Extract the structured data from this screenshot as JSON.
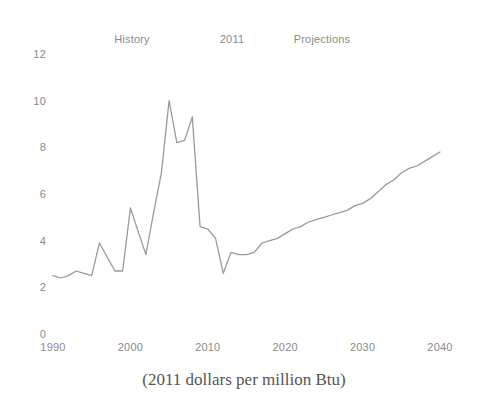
{
  "header": {
    "history_label": "History",
    "divider_year_label": "2011",
    "projections_label": "Projections"
  },
  "caption": "(2011 dollars per million Btu)",
  "axis": {
    "y_ticks": [
      "0",
      "2",
      "4",
      "6",
      "8",
      "10",
      "12"
    ],
    "x_ticks": [
      "1990",
      "2000",
      "2010",
      "2020",
      "2030",
      "2040"
    ]
  },
  "style": {
    "line_color": "#9a9a9a",
    "text_color": "#8a8a8a",
    "caption_color": "#555555",
    "background": "#ffffff"
  },
  "chart_data": {
    "type": "line",
    "title": "",
    "subtitle": "",
    "xlabel": "",
    "ylabel": "",
    "caption": "(2011 dollars per million Btu)",
    "xlim": [
      1990,
      2040
    ],
    "ylim": [
      0,
      12
    ],
    "grid": false,
    "legend_position": "none",
    "annotations": [
      {
        "text": "History",
        "x": 1990,
        "note": "region label for historical data left of 2011"
      },
      {
        "text": "2011",
        "x": 2011,
        "note": "boundary year between history and projections"
      },
      {
        "text": "Projections",
        "x": 2030,
        "note": "region label for projected data right of 2011"
      }
    ],
    "series": [
      {
        "name": "Natural gas price",
        "units": "2011 dollars per million Btu",
        "x": [
          1990,
          1991,
          1992,
          1993,
          1994,
          1995,
          1996,
          1997,
          1998,
          1999,
          2000,
          2001,
          2002,
          2003,
          2004,
          2005,
          2006,
          2007,
          2008,
          2009,
          2010,
          2011,
          2012,
          2013,
          2014,
          2015,
          2016,
          2017,
          2018,
          2019,
          2020,
          2021,
          2022,
          2023,
          2024,
          2025,
          2026,
          2027,
          2028,
          2029,
          2030,
          2031,
          2032,
          2033,
          2034,
          2035,
          2036,
          2037,
          2038,
          2039,
          2040
        ],
        "y": [
          2.5,
          2.4,
          2.5,
          2.7,
          2.6,
          2.5,
          3.9,
          3.3,
          2.7,
          2.7,
          5.4,
          4.4,
          3.4,
          5.2,
          6.9,
          10.0,
          8.2,
          8.3,
          9.3,
          4.6,
          4.5,
          4.1,
          2.6,
          3.5,
          3.4,
          3.4,
          3.5,
          3.9,
          4.0,
          4.1,
          4.3,
          4.5,
          4.6,
          4.8,
          4.9,
          5.0,
          5.1,
          5.2,
          5.3,
          5.5,
          5.6,
          5.8,
          6.1,
          6.4,
          6.6,
          6.9,
          7.1,
          7.2,
          7.4,
          7.6,
          7.8
        ]
      }
    ]
  }
}
